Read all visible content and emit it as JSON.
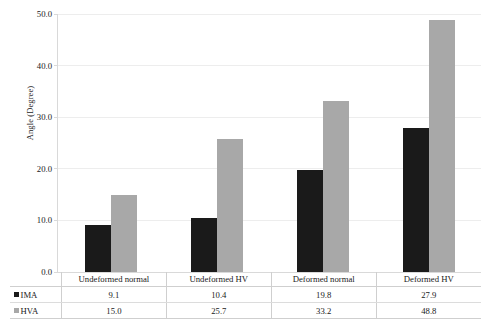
{
  "chart_data": {
    "type": "bar",
    "title": "",
    "xlabel": "",
    "ylabel": "Angle (Degree)",
    "ylim": [
      0.0,
      50.0
    ],
    "ytick_labels": [
      "0.0",
      "10.0",
      "20.0",
      "30.0",
      "40.0",
      "50.0"
    ],
    "ytick_values": [
      0.0,
      10.0,
      20.0,
      30.0,
      40.0,
      50.0
    ],
    "grid": true,
    "legend_position": "table-row-header",
    "categories": [
      "Undeformed normal",
      "Undeformed HV",
      "Deformed normal",
      "Deformed HV"
    ],
    "series": [
      {
        "name": "IMA",
        "color": "#1a1a1a",
        "values": [
          9.1,
          10.4,
          19.8,
          27.9
        ],
        "value_labels": [
          "9.1",
          "10.4",
          "19.8",
          "27.9"
        ]
      },
      {
        "name": "HVA",
        "color": "#a8a8a8",
        "values": [
          15.0,
          25.7,
          33.2,
          48.8
        ],
        "value_labels": [
          "15.0",
          "25.7",
          "33.2",
          "48.8"
        ]
      }
    ]
  },
  "table": {
    "row_header_blank": "",
    "legend_labels": [
      "IMA",
      "HVA"
    ]
  },
  "colors": {
    "series_ima": "#1a1a1a",
    "series_hva": "#a8a8a8",
    "gridline": "#ededed",
    "axis": "#d9d9d9",
    "table_border": "#cfcfcf",
    "text": "#1a1a1a",
    "background": "#ffffff"
  }
}
